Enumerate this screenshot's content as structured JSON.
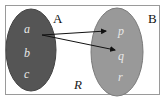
{
  "diagram": {
    "type": "relation-mapping",
    "universe_label": "R",
    "sets": [
      {
        "name": "A",
        "elements": [
          "a",
          "b",
          "c"
        ],
        "fill": "#555555"
      },
      {
        "name": "B",
        "elements": [
          "p",
          "q",
          "r"
        ],
        "fill": "#999999"
      }
    ],
    "arrows": [
      {
        "from": "a",
        "to": "p"
      },
      {
        "from": "a",
        "to": "q"
      }
    ]
  }
}
